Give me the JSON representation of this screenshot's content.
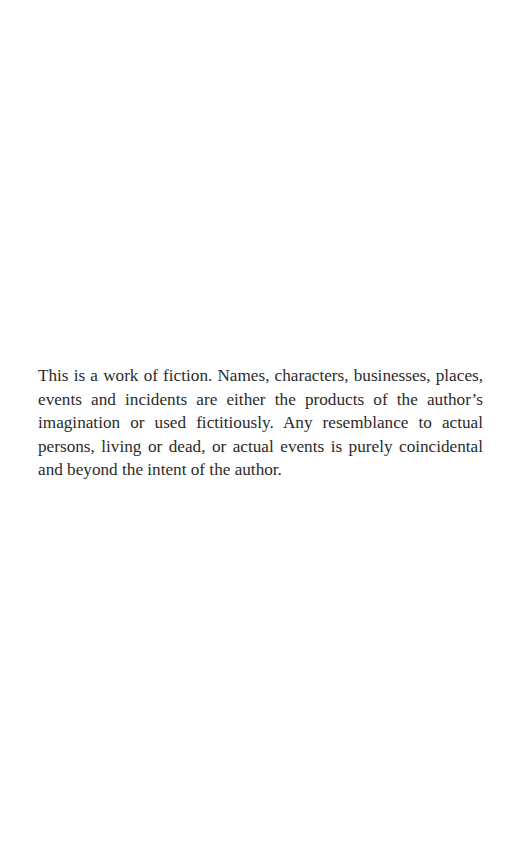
{
  "page": {
    "type": "copyright-disclaimer",
    "disclaimer_text": "This is a work of fiction. Names, characters, businesses, places, events and incidents are either the products of the author’s imagination or used ficti­tiously. Any resemblance to actual persons, living or dead, or actual events is purely coincidental and beyond the intent of the author."
  },
  "colors": {
    "background": "#ffffff",
    "text": "#2b2b2b"
  }
}
